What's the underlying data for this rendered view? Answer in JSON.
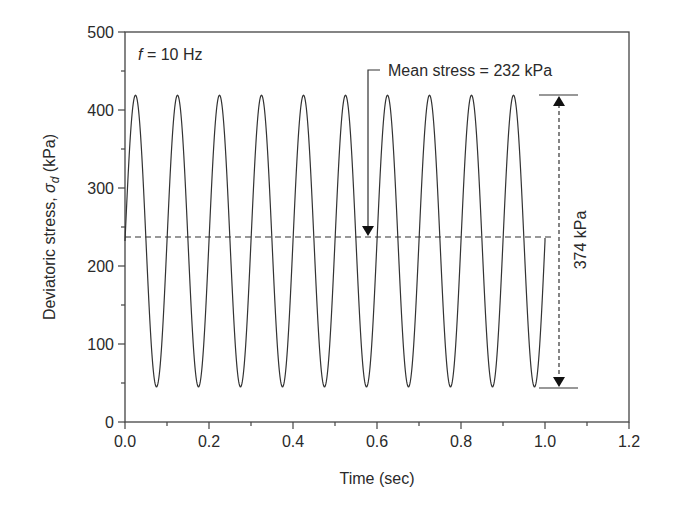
{
  "chart_data": {
    "type": "line",
    "title": "",
    "xlabel": "Time (sec)",
    "ylabel": "Deviatoric stress, σ_d (kPa)",
    "ylabel_parts": {
      "prefix": "Deviatoric stress, ",
      "symbol": "σ",
      "subscript": "d",
      "suffix": " (kPa)"
    },
    "xlim": [
      0.0,
      1.2
    ],
    "ylim": [
      0,
      500
    ],
    "xticks": [
      "0.0",
      "0.2",
      "0.4",
      "0.6",
      "0.8",
      "1.0",
      "1.2"
    ],
    "yticks": [
      "0",
      "100",
      "200",
      "300",
      "400",
      "500"
    ],
    "grid": false,
    "legend": null,
    "series": [
      {
        "name": "Deviatoric stress (sinusoidal loading)",
        "frequency_hz": 10,
        "mean_kpa": 232,
        "max_kpa": 419,
        "min_kpa": 45,
        "t_start": 0.0,
        "t_end": 1.0,
        "peaks_t": [
          0.025,
          0.125,
          0.225,
          0.325,
          0.425,
          0.525,
          0.625,
          0.725,
          0.825,
          0.925
        ],
        "troughs_t": [
          0.075,
          0.175,
          0.275,
          0.375,
          0.475,
          0.575,
          0.675,
          0.775,
          0.875,
          0.975
        ]
      }
    ],
    "annotations": {
      "frequency": {
        "italic": "f",
        "text": " = 10 Hz"
      },
      "mean_stress": "Mean stress = 232 kPa",
      "amplitude": "374 kPa"
    }
  }
}
